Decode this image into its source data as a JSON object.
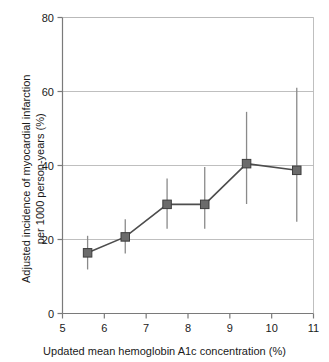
{
  "chart_data": {
    "type": "line",
    "title": "",
    "subtitle": "",
    "xlabel": "Updated mean hemoglobin A1c concentration (%)",
    "ylabel_line1": "Adjusted incidence of myocardial infarction",
    "ylabel_line2": "per 1000 person-years (%)",
    "xlim": [
      5,
      11
    ],
    "ylim": [
      0,
      80
    ],
    "xticks": [
      5,
      6,
      7,
      8,
      9,
      10,
      11
    ],
    "xtick_labels": [
      "5",
      "6",
      "7",
      "8",
      "9",
      "10",
      "11"
    ],
    "yticks": [
      0,
      20,
      40,
      60,
      80
    ],
    "ytick_labels": [
      "0",
      "20",
      "40",
      "60",
      "80"
    ],
    "grid": "horizontal",
    "legend": "none",
    "marker": "square",
    "marker_color": "#6b6b6b",
    "line_color": "#4d4d4d",
    "errorbar_color": "#8a8a8a",
    "grid_color": "#b8b8b8",
    "axis_color": "#7a7a7a",
    "x": [
      5.6,
      6.5,
      7.5,
      8.4,
      9.4,
      10.6
    ],
    "values": [
      16.4,
      20.7,
      29.5,
      29.5,
      40.5,
      38.7
    ],
    "error_low": [
      11.9,
      16.2,
      22.9,
      22.9,
      29.6,
      24.8
    ],
    "error_high": [
      21.0,
      25.5,
      36.5,
      39.6,
      54.5,
      61.0
    ],
    "points": [
      {
        "x": 5.6,
        "y": 16.4,
        "lo": 11.9,
        "hi": 21.0
      },
      {
        "x": 6.5,
        "y": 20.7,
        "lo": 16.2,
        "hi": 25.5
      },
      {
        "x": 7.5,
        "y": 29.5,
        "lo": 22.9,
        "hi": 36.5
      },
      {
        "x": 8.4,
        "y": 29.5,
        "lo": 22.9,
        "hi": 39.6
      },
      {
        "x": 9.4,
        "y": 40.5,
        "lo": 29.6,
        "hi": 54.5
      },
      {
        "x": 10.6,
        "y": 38.7,
        "lo": 24.8,
        "hi": 61.0
      }
    ]
  }
}
